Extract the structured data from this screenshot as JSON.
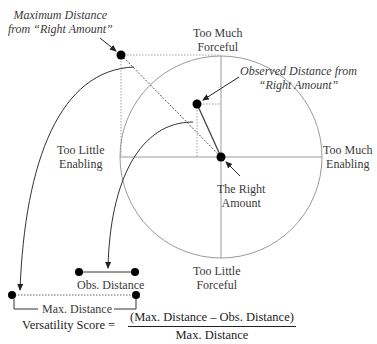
{
  "diagram": {
    "axes": {
      "top": [
        "Too Much",
        "Forceful"
      ],
      "bottom": [
        "Too Little",
        "Forceful"
      ],
      "left": [
        "Too Little",
        "Enabling"
      ],
      "right": [
        "Too Much",
        "Enabling"
      ]
    },
    "callouts": {
      "max_distance": [
        "Maximum Distance",
        "from “Right Amount”"
      ],
      "observed_distance": [
        "Observed Distance from",
        "“Right Amount”"
      ],
      "right_amount": [
        "The Right",
        "Amount"
      ]
    },
    "bars": {
      "obs_distance": "Obs. Distance",
      "max_distance": "Max. Distance"
    },
    "formula": {
      "lhs": "Versatility Score =",
      "numerator": "(Max. Distance – Obs. Distance)",
      "denominator": "Max. Distance"
    },
    "colors": {
      "line": "#333333",
      "circle": "#9a9a9a",
      "dot": "#000000"
    }
  }
}
